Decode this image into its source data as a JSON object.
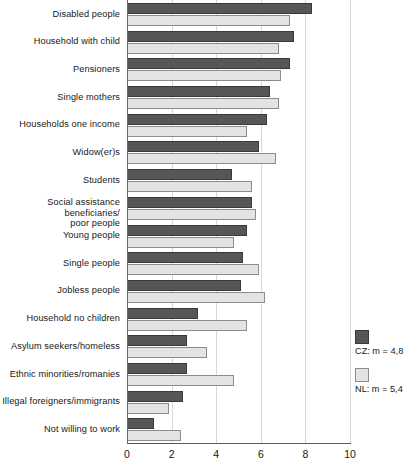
{
  "chart_data": {
    "type": "bar",
    "orientation": "horizontal",
    "title": "",
    "xlabel": "",
    "ylabel": "",
    "xlim": [
      0,
      10
    ],
    "xticks": [
      0,
      2,
      4,
      6,
      8,
      10
    ],
    "xtick_labels": [
      "0",
      "2",
      "4",
      "6",
      "8",
      "10"
    ],
    "grid": true,
    "grid_axis": "x",
    "legend_position": "right",
    "categories": [
      "Disabled people",
      "Household with child",
      "Pensioners",
      "Single mothers",
      "Households one income",
      "Widow(er)s",
      "Students",
      "Social assistance beneficiaries/\npoor people",
      "Young people",
      "Single people",
      "Jobless people",
      "Household no children",
      "Asylum seekers/homeless",
      "Ethnic minorities/romanies",
      "Illegal foreigners/immigrants",
      "Not willing to work"
    ],
    "series": [
      {
        "name": "CZ: m = 4,8",
        "short": "CZ",
        "mean": 4.8,
        "color": "#565656",
        "values": [
          8.3,
          7.5,
          7.3,
          6.4,
          6.3,
          5.9,
          4.7,
          5.6,
          5.4,
          5.2,
          5.1,
          3.2,
          2.7,
          2.7,
          2.5,
          1.2
        ]
      },
      {
        "name": "NL: m = 5,4",
        "short": "NL",
        "mean": 5.4,
        "color": "#e3e3e3",
        "values": [
          7.3,
          6.8,
          6.9,
          6.8,
          5.4,
          6.7,
          5.6,
          5.8,
          4.8,
          5.9,
          6.2,
          5.4,
          3.6,
          4.8,
          1.9,
          2.4
        ]
      }
    ]
  },
  "legend": {
    "items": [
      {
        "label": "CZ: m = 4,8",
        "color": "#565656"
      },
      {
        "label": "NL: m = 5,4",
        "color": "#e3e3e3"
      }
    ]
  }
}
